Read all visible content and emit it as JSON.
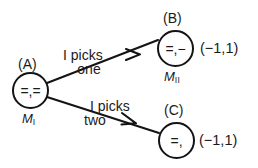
{
  "diagram": {
    "type": "game-tree",
    "nodes": [
      {
        "id": "A",
        "tag": "(A)",
        "inner_text": "=,=",
        "sub_label_base": "M",
        "sub_label_sub": "I"
      },
      {
        "id": "B",
        "tag": "(B)",
        "inner_text": "=,−",
        "sub_label_base": "M",
        "sub_label_sub": "II",
        "payoff": "(−1,1)"
      },
      {
        "id": "C",
        "tag": "(C)",
        "inner_text": "=,",
        "payoff": "(−1,1)"
      }
    ],
    "edges": [
      {
        "from": "A",
        "to": "B",
        "label_line1": "I picks",
        "label_line2": "one"
      },
      {
        "from": "A",
        "to": "C",
        "label_line1": "I picks",
        "label_line2": "two"
      }
    ],
    "colors": {
      "stroke": "#141414",
      "background": "#ffffff",
      "text": "#1a1a1a"
    }
  }
}
